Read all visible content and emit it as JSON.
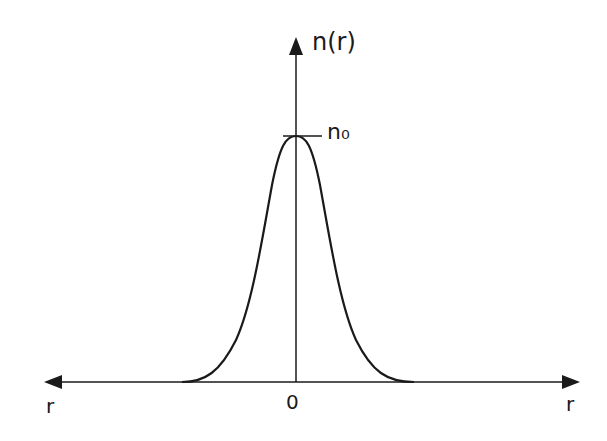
{
  "diagram": {
    "title": "",
    "labels": {
      "y_axis": "n(r)",
      "peak": "n₀",
      "origin": "0",
      "x_axis_left": "r",
      "x_axis_right": "r"
    },
    "colors": {
      "background": "#ffffff",
      "ink": "#1a1a1a"
    },
    "curve": {
      "shape": "bell",
      "peak_value_label": "n₀",
      "peak_position": "r = 0",
      "symmetric": true
    }
  }
}
